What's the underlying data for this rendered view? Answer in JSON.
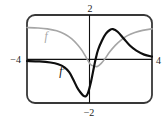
{
  "figure": {
    "description_labels": {
      "y_max_tick": "2",
      "y_min_tick": "−2",
      "x_min_tick": "−4",
      "x_max_tick": "4"
    },
    "border_color": "#383838",
    "axis_color": "#111111",
    "background_color": "#ffffff"
  },
  "chart_data": {
    "type": "line",
    "title": "",
    "xlabel": "",
    "ylabel": "",
    "axes": {
      "xlim": [
        -4,
        4
      ],
      "ylim": [
        -2,
        2
      ],
      "grid": false,
      "ticks": {
        "top": "2",
        "bottom": "−2",
        "left": "−4",
        "right": "4"
      }
    },
    "legend": "inline-curve-labels",
    "series": [
      {
        "name": "f",
        "label": "f",
        "color": "#a6a6a6",
        "stroke_width": 1.6,
        "points": [
          [
            -4,
            1.43
          ],
          [
            -3.3,
            1.41
          ],
          [
            -2.7,
            1.37
          ],
          [
            -2.1,
            1.28
          ],
          [
            -1.6,
            1.14
          ],
          [
            -1.15,
            0.93
          ],
          [
            -0.75,
            0.64
          ],
          [
            -0.45,
            0.36
          ],
          [
            -0.2,
            0.05
          ],
          [
            0.05,
            -0.24
          ],
          [
            0.3,
            -0.33
          ],
          [
            0.5,
            -0.34
          ],
          [
            0.75,
            -0.2
          ],
          [
            1,
            0.02
          ],
          [
            1.3,
            0.33
          ],
          [
            1.65,
            0.62
          ],
          [
            2,
            0.85
          ],
          [
            2.4,
            1.05
          ],
          [
            2.9,
            1.2
          ],
          [
            3.4,
            1.3
          ],
          [
            4,
            1.37
          ]
        ]
      },
      {
        "name": "f-prime",
        "label": "f′",
        "color": "#0e0e0e",
        "stroke_width": 2.2,
        "points": [
          [
            -4,
            -0.09
          ],
          [
            -3.2,
            -0.11
          ],
          [
            -2.5,
            -0.16
          ],
          [
            -2,
            -0.24
          ],
          [
            -1.6,
            -0.38
          ],
          [
            -1.3,
            -0.6
          ],
          [
            -1.05,
            -0.92
          ],
          [
            -0.8,
            -1.28
          ],
          [
            -0.6,
            -1.5
          ],
          [
            -0.4,
            -1.66
          ],
          [
            -0.25,
            -1.7
          ],
          [
            -0.1,
            -1.55
          ],
          [
            0.1,
            -1.02
          ],
          [
            0.27,
            -0.42
          ],
          [
            0.4,
            0.02
          ],
          [
            0.55,
            0.42
          ],
          [
            0.8,
            0.84
          ],
          [
            1.05,
            1.15
          ],
          [
            1.3,
            1.32
          ],
          [
            1.5,
            1.36
          ],
          [
            1.8,
            1.24
          ],
          [
            2.2,
            0.92
          ],
          [
            2.6,
            0.6
          ],
          [
            3,
            0.38
          ],
          [
            3.5,
            0.2
          ],
          [
            4,
            0.11
          ]
        ]
      }
    ]
  }
}
